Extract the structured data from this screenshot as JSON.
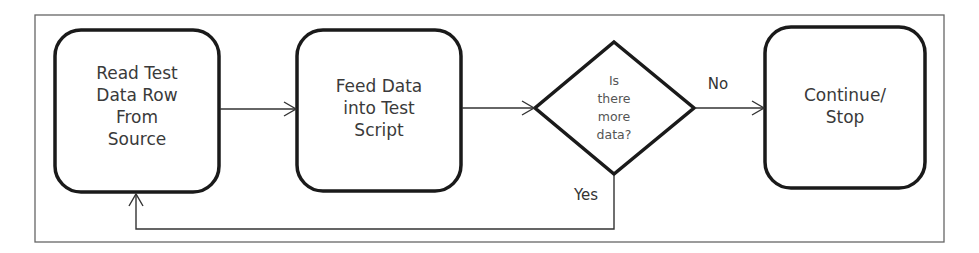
{
  "diagram": {
    "nodes": [
      {
        "id": "read",
        "shape": "rounded-rect",
        "lines": [
          "Read Test",
          "Data Row",
          "From",
          "Source"
        ]
      },
      {
        "id": "feed",
        "shape": "rounded-rect",
        "lines": [
          "Feed Data",
          "into Test",
          "Script"
        ]
      },
      {
        "id": "decision",
        "shape": "diamond",
        "lines": [
          "Is",
          "there",
          "more",
          "data?"
        ]
      },
      {
        "id": "end",
        "shape": "rounded-rect",
        "lines": [
          "Continue/",
          "Stop"
        ]
      }
    ],
    "edges": [
      {
        "from": "read",
        "to": "feed",
        "label": ""
      },
      {
        "from": "feed",
        "to": "decision",
        "label": ""
      },
      {
        "from": "decision",
        "to": "end",
        "label": "No"
      },
      {
        "from": "decision",
        "to": "read",
        "label": "Yes"
      }
    ],
    "colors": {
      "stroke": "#1a1a1a",
      "frame": "#555555",
      "text": "#3a3a3a"
    }
  }
}
